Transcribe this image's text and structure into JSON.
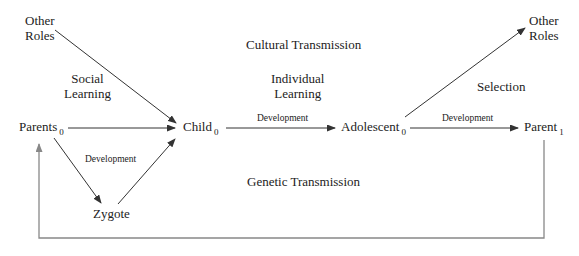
{
  "diagram": {
    "nodes": {
      "other_roles_left": {
        "line1": "Other",
        "line2": "Roles"
      },
      "parents0": {
        "label": "Parents",
        "sub": "0"
      },
      "child0": {
        "label": "Child",
        "sub": "0"
      },
      "zygote": {
        "label": "Zygote"
      },
      "adolescent0": {
        "label": "Adolescent",
        "sub": "0"
      },
      "parent1": {
        "label": "Parent",
        "sub": "1"
      },
      "other_roles_right": {
        "line1": "Other",
        "line2": "Roles"
      }
    },
    "regions": {
      "cultural_transmission": "Cultural Transmission",
      "social_learning": {
        "line1": "Social",
        "line2": "Learning"
      },
      "individual_learning": {
        "line1": "Individual",
        "line2": "Learning"
      },
      "selection": "Selection",
      "genetic_transmission": "Genetic Transmission"
    },
    "edge_labels": {
      "child_to_adolescent": "Development",
      "adolescent_to_parent": "Development",
      "parents_to_zygote_to_child": "Development"
    },
    "colors": {
      "arrow": "#333333",
      "feedback_arrow": "#888888",
      "text": "#222222"
    }
  }
}
